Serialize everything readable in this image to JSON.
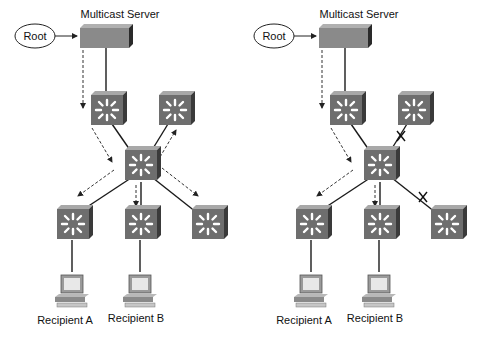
{
  "diagrams": [
    {
      "name": "left",
      "server_label": "Multicast Server",
      "root_label": "Root",
      "recipients": [
        "Recipient A",
        "Recipient B"
      ],
      "blocked_links": []
    },
    {
      "name": "right",
      "server_label": "Multicast Server",
      "root_label": "Root",
      "recipients": [
        "Recipient A",
        "Recipient B"
      ],
      "blocked_links": [
        "core-to-top-right",
        "core-to-bottom-right"
      ]
    }
  ],
  "colors": {
    "switch_front": "#6e6e6e",
    "switch_top": "#a0a0a0",
    "switch_side": "#3c3c3c",
    "server": "#8a8a8a",
    "line": "#1a1a1a"
  }
}
